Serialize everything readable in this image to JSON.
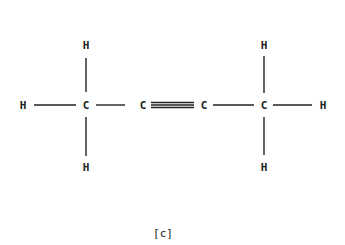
{
  "diagram": {
    "type": "structural-formula",
    "molecule": "but-2-yne (CH3-C≡C-CH3)",
    "atoms": [
      {
        "id": "h_left",
        "label": "H",
        "x": 23,
        "y": 105
      },
      {
        "id": "c1",
        "label": "C",
        "x": 86,
        "y": 105
      },
      {
        "id": "h_c1_top",
        "label": "H",
        "x": 86,
        "y": 45
      },
      {
        "id": "h_c1_bottom",
        "label": "H",
        "x": 86,
        "y": 167
      },
      {
        "id": "c2",
        "label": "C",
        "x": 143,
        "y": 105
      },
      {
        "id": "c3",
        "label": "C",
        "x": 204,
        "y": 105
      },
      {
        "id": "c4",
        "label": "C",
        "x": 264,
        "y": 105
      },
      {
        "id": "h_c4_top",
        "label": "H",
        "x": 264,
        "y": 45
      },
      {
        "id": "h_c4_bottom",
        "label": "H",
        "x": 264,
        "y": 167
      },
      {
        "id": "h_right",
        "label": "H",
        "x": 323,
        "y": 105
      }
    ],
    "bonds": [
      {
        "from": "h_left",
        "to": "c1",
        "order": 1
      },
      {
        "from": "c1",
        "to": "h_c1_top",
        "order": 1
      },
      {
        "from": "c1",
        "to": "h_c1_bottom",
        "order": 1
      },
      {
        "from": "c1",
        "to": "c2",
        "order": 1
      },
      {
        "from": "c2",
        "to": "c3",
        "order": 3
      },
      {
        "from": "c3",
        "to": "c4",
        "order": 1
      },
      {
        "from": "c4",
        "to": "h_c4_top",
        "order": 1
      },
      {
        "from": "c4",
        "to": "h_c4_bottom",
        "order": 1
      },
      {
        "from": "c4",
        "to": "h_right",
        "order": 1
      }
    ],
    "caption": "[c]"
  }
}
